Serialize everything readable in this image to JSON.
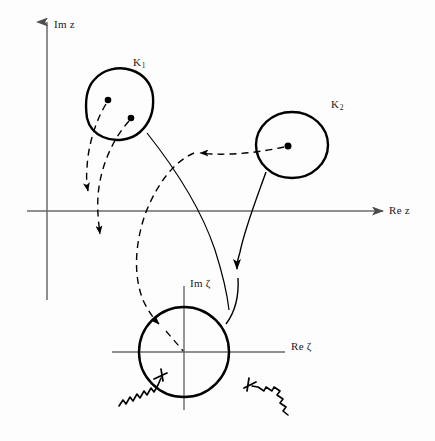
{
  "figure": {
    "background_color": "#fdfdfd",
    "axis_color": "#666666",
    "curve_color": "#000000",
    "width": 435,
    "height": 441
  },
  "labels": {
    "im_z": "Im z",
    "re_z": "Re z",
    "im_zeta": "Im ζ",
    "re_zeta": "Re ζ",
    "k1_base": "K",
    "k1_sub": "1",
    "k2_base": "K",
    "k2_sub": "2"
  },
  "z_plane": {
    "origin": {
      "x": 47,
      "y": 211
    },
    "im_axis": {
      "x": 47,
      "y_top": 18,
      "y_bottom": 300,
      "arrow": "up"
    },
    "re_axis": {
      "y": 211,
      "x_left": 27,
      "x_right": 385,
      "arrow": "right"
    }
  },
  "zeta_plane": {
    "origin": {
      "x": 184,
      "y": 352
    },
    "im_axis": {
      "x": 184,
      "y_top": 283,
      "y_bottom": 410,
      "arrow": "none"
    },
    "re_axis": {
      "y": 352,
      "x_left": 112,
      "x_right": 285,
      "arrow": "none"
    },
    "circle": {
      "cx": 184,
      "cy": 352,
      "r": 45
    }
  },
  "regions": [
    {
      "name": "K1",
      "shape": "irregular-blob",
      "label_x": 137,
      "label_y": 57,
      "points": [
        {
          "x": 102,
          "y": 136
        },
        {
          "x": 138,
          "y": 137
        },
        {
          "x": 153,
          "y": 115
        },
        {
          "x": 150,
          "y": 88
        },
        {
          "x": 130,
          "y": 70
        },
        {
          "x": 106,
          "y": 69
        },
        {
          "x": 88,
          "y": 85
        },
        {
          "x": 86,
          "y": 106
        },
        {
          "x": 89,
          "y": 124
        }
      ],
      "dots": [
        {
          "x": 108,
          "y": 100,
          "r": 3.2
        },
        {
          "x": 131,
          "y": 118,
          "r": 3.2
        }
      ]
    },
    {
      "name": "K2",
      "shape": "ellipse",
      "label_x": 332,
      "label_y": 99,
      "cx": 292,
      "cy": 145,
      "rx": 36,
      "ry": 33,
      "dots": [
        {
          "x": 288,
          "y": 146,
          "r": 3.4
        }
      ]
    }
  ],
  "solid_curves": [
    {
      "name": "k1-to-zeta-origin",
      "from": "K1 boundary",
      "to": "zeta plane",
      "arrow": false
    },
    {
      "name": "k2-to-zeta-circle",
      "from": "K2 boundary",
      "to": "zeta circle",
      "arrow": true,
      "arrow_at": {
        "x": 238,
        "y": 272
      }
    }
  ],
  "dashed_curves": [
    {
      "name": "k1-dot1-down",
      "arrow_at": {
        "x": 89,
        "y": 196
      }
    },
    {
      "name": "k1-dot2-down",
      "arrow_at": {
        "x": 101,
        "y": 240
      }
    },
    {
      "name": "k2-dot-to-left",
      "arrow_at": {
        "x": 195,
        "y": 152
      }
    },
    {
      "name": "long-dashed-to-zeta-circle",
      "arrow_at": {
        "x": 163,
        "y": 327
      }
    }
  ],
  "squiggle_markers": [
    {
      "name": "squiggle-left",
      "start": {
        "x": 120,
        "y": 405
      },
      "tip": {
        "x": 163,
        "y": 375
      },
      "direction": "up-right"
    },
    {
      "name": "squiggle-right",
      "start": {
        "x": 287,
        "y": 414
      },
      "tip": {
        "x": 248,
        "y": 386
      },
      "direction": "up-left"
    }
  ]
}
